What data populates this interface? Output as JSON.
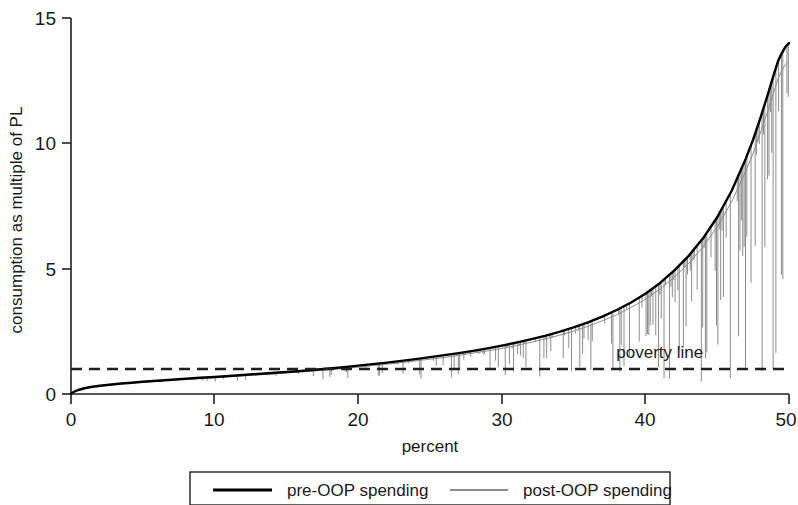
{
  "chart_data": {
    "type": "line",
    "title": "",
    "xlabel": "percent",
    "ylabel": "consumption as multiple of PL",
    "xlim": [
      0,
      50
    ],
    "ylim": [
      0,
      15
    ],
    "xticks": [
      "0",
      "10",
      "20",
      "30",
      "40",
      "50"
    ],
    "xtick_values": [
      0,
      10,
      20,
      30,
      40,
      50
    ],
    "yticks": [
      "0",
      "5",
      "10",
      "15"
    ],
    "ytick_values": [
      0,
      5,
      10,
      15
    ],
    "grid": false,
    "legend_position": "below-plot",
    "annotations": [
      {
        "name": "poverty-line-label",
        "text": "poverty line",
        "x": 41.0,
        "y": 1.45
      }
    ],
    "reference_lines": [
      {
        "name": "poverty-line",
        "orientation": "horizontal",
        "value": 1.0,
        "style": "dashed",
        "color": "#231f20"
      }
    ],
    "series": [
      {
        "name": "pre-OOP spending",
        "color": "#000000",
        "style": "solid",
        "x": [
          0,
          0.25,
          0.5,
          0.75,
          1,
          1.5,
          2,
          2.5,
          3,
          3.5,
          4,
          5,
          6,
          7,
          8,
          9,
          10,
          11,
          12,
          13,
          14,
          15,
          16,
          17,
          18,
          19,
          20,
          21,
          22,
          23,
          24,
          25,
          26,
          27,
          28,
          29,
          30,
          31,
          32,
          33,
          34,
          35,
          36,
          37,
          38,
          39,
          40,
          41,
          42,
          43,
          44,
          45,
          46,
          47,
          47.5,
          48,
          48.5,
          49,
          49.25,
          49.5,
          49.75,
          50
        ],
        "y": [
          0.02,
          0.1,
          0.16,
          0.2,
          0.24,
          0.29,
          0.33,
          0.36,
          0.39,
          0.42,
          0.44,
          0.49,
          0.53,
          0.57,
          0.61,
          0.65,
          0.68,
          0.72,
          0.76,
          0.8,
          0.84,
          0.88,
          0.92,
          0.97,
          1.02,
          1.07,
          1.13,
          1.19,
          1.25,
          1.32,
          1.39,
          1.47,
          1.55,
          1.63,
          1.72,
          1.82,
          1.93,
          2.05,
          2.18,
          2.32,
          2.48,
          2.66,
          2.86,
          3.09,
          3.35,
          3.65,
          4.0,
          4.42,
          4.92,
          5.5,
          6.2,
          7.05,
          8.1,
          9.4,
          10.15,
          11.0,
          11.9,
          12.85,
          13.3,
          13.6,
          13.85,
          14.0
        ]
      },
      {
        "name": "post-OOP spending",
        "color": "#8c8c8c",
        "style": "solid-with-downward-spikes",
        "description": "Tracks just below the pre-OOP curve; individual downward spikes grow larger toward the right of the distribution.",
        "x": [
          0,
          0.25,
          0.5,
          0.75,
          1,
          1.5,
          2,
          2.5,
          3,
          3.5,
          4,
          5,
          6,
          7,
          8,
          9,
          10,
          11,
          12,
          13,
          14,
          15,
          16,
          17,
          18,
          19,
          20,
          21,
          22,
          23,
          24,
          25,
          26,
          27,
          28,
          29,
          30,
          31,
          32,
          33,
          34,
          35,
          36,
          37,
          38,
          39,
          40,
          41,
          42,
          43,
          44,
          45,
          46,
          47,
          47.5,
          48,
          48.5,
          49,
          49.25,
          49.5,
          49.75,
          50
        ],
        "y": [
          0.01,
          0.08,
          0.14,
          0.18,
          0.22,
          0.27,
          0.31,
          0.34,
          0.37,
          0.4,
          0.42,
          0.47,
          0.51,
          0.55,
          0.59,
          0.62,
          0.65,
          0.69,
          0.73,
          0.76,
          0.8,
          0.84,
          0.88,
          0.92,
          0.97,
          1.02,
          1.07,
          1.13,
          1.19,
          1.25,
          1.32,
          1.39,
          1.46,
          1.54,
          1.63,
          1.72,
          1.82,
          1.93,
          2.06,
          2.19,
          2.34,
          2.51,
          2.7,
          2.92,
          3.16,
          3.45,
          3.78,
          4.18,
          4.65,
          5.2,
          5.86,
          6.67,
          7.66,
          8.9,
          9.6,
          10.4,
          11.25,
          12.15,
          12.6,
          12.9,
          13.15,
          13.3
        ]
      }
    ]
  },
  "legend": {
    "entries": [
      {
        "label": "pre-OOP spending",
        "color": "#000000",
        "swatch": "solid-line-swatch"
      },
      {
        "label": "post-OOP spending",
        "color": "#8c8c8c",
        "swatch": "thin-line-swatch"
      }
    ]
  }
}
